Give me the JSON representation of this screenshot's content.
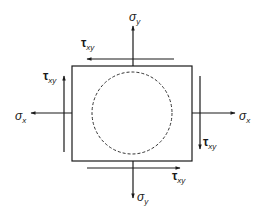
{
  "diagram": {
    "colors": {
      "stroke": "#1a1a1a",
      "background": "#ffffff"
    },
    "element": {
      "shape": "square",
      "x": 72,
      "y": 66,
      "width": 120,
      "height": 95
    },
    "inscribed_circle": {
      "style": "dashed",
      "cx": 132,
      "cy": 113,
      "rx": 40,
      "ry": 41
    },
    "labels": {
      "sigma_y_top": {
        "symbol": "σ",
        "subscript": "y"
      },
      "sigma_y_bottom": {
        "symbol": "σ",
        "subscript": "y"
      },
      "sigma_x_left": {
        "symbol": "σ",
        "subscript": "x"
      },
      "sigma_x_right": {
        "symbol": "σ",
        "subscript": "x"
      },
      "tau_xy_top": {
        "symbol": "τ",
        "subscript": "xy"
      },
      "tau_xy_left": {
        "symbol": "τ",
        "subscript": "xy"
      },
      "tau_xy_right": {
        "symbol": "τ",
        "subscript": "xy"
      },
      "tau_xy_bottom": {
        "symbol": "τ",
        "subscript": "xy"
      }
    },
    "arrows": [
      {
        "name": "sigma-y-top",
        "direction": "up"
      },
      {
        "name": "sigma-y-bottom",
        "direction": "down"
      },
      {
        "name": "sigma-x-left",
        "direction": "left"
      },
      {
        "name": "sigma-x-right",
        "direction": "right"
      },
      {
        "name": "tau-xy-top",
        "direction": "left"
      },
      {
        "name": "tau-xy-bottom",
        "direction": "right"
      },
      {
        "name": "tau-xy-left",
        "direction": "up"
      },
      {
        "name": "tau-xy-right",
        "direction": "down"
      }
    ]
  }
}
